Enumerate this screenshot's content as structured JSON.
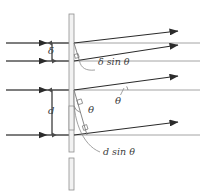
{
  "figure": {
    "kind": "optics-diagram",
    "width": 205,
    "height": 195,
    "background": "#ffffff"
  },
  "colors": {
    "ray": "#2b2b2b",
    "reference_line": "#9a9a9a",
    "barrier_stroke": "#8f8f8f",
    "barrier_fill": "#f2f2f2",
    "leader": "#8a8a8a",
    "dimension": "#4a4a4a",
    "text": "#3b3b3b"
  },
  "labels": {
    "delta": "δ",
    "delta_sin_theta": "δ sin θ",
    "d": "d",
    "d_sin_theta": "d sin θ",
    "theta_upper": "θ",
    "theta_lower": "θ"
  },
  "geometry": {
    "barrier": {
      "x": 69,
      "y_top": 14,
      "y_bottom": 152,
      "width": 5
    },
    "barrier_lower_segment": {
      "x": 69,
      "y_top": 158,
      "y_bottom": 190,
      "width": 5
    },
    "slit_block_middle": {
      "x": 69,
      "y_top": 106,
      "y_bottom": 130,
      "width": 5
    },
    "incoming_rays_y": [
      43,
      61,
      90,
      135
    ],
    "incoming_ray_x_start": 6,
    "incoming_ray_arrow_x": 46,
    "reference_lines_y": [
      43,
      61,
      90,
      135
    ],
    "reference_line_x_end": 200,
    "outgoing_rays": [
      {
        "from_x": 74,
        "from_y": 43,
        "to_x": 178,
        "to_y": 31
      },
      {
        "from_x": 74,
        "from_y": 61,
        "to_x": 178,
        "to_y": 45
      },
      {
        "from_x": 74,
        "from_y": 90,
        "to_x": 178,
        "to_y": 76
      },
      {
        "from_x": 74,
        "from_y": 135,
        "to_x": 178,
        "to_y": 122
      }
    ],
    "delta_dimension": {
      "x": 52,
      "y_top": 43,
      "y_bottom": 61
    },
    "d_dimension": {
      "x": 52,
      "y_top": 90,
      "y_bottom": 135
    }
  },
  "annotations": [
    {
      "name": "delta-gap",
      "text": "δ",
      "x": 49,
      "y": 47
    },
    {
      "name": "delta-sin-theta",
      "text": "δ sin θ",
      "x": 98,
      "y": 63
    },
    {
      "name": "d-gap",
      "text": "d",
      "x": 48,
      "y": 107
    },
    {
      "name": "d-sin-theta",
      "text": "d sin θ",
      "x": 103,
      "y": 157
    },
    {
      "name": "theta-ray-angle",
      "text": "θ",
      "x": 117,
      "y": 95
    },
    {
      "name": "theta-slit-angle",
      "text": "θ",
      "x": 90,
      "y": 111
    }
  ]
}
